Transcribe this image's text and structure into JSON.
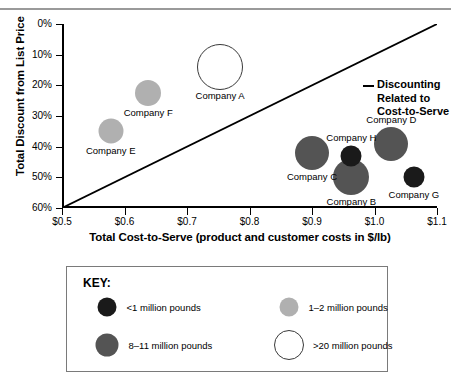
{
  "chart_data": {
    "type": "scatter",
    "title": "",
    "xlabel": "Total Cost-to-Serve (product and customer costs in $/lb)",
    "ylabel": "Total Discount from List Price",
    "xlim": [
      0.5,
      1.1
    ],
    "ylim": [
      0,
      60
    ],
    "y_inverted": true,
    "grid": false,
    "xticks": [
      "$0.5",
      "$0.6",
      "$0.7",
      "$0.8",
      "$0.9",
      "$1.0",
      "$1.1"
    ],
    "xtick_values": [
      0.5,
      0.6,
      0.7,
      0.8,
      0.9,
      1.0,
      1.1
    ],
    "yticks": [
      "0%",
      "10%",
      "20%",
      "30%",
      "40%",
      "50%",
      "60%"
    ],
    "ytick_values": [
      0,
      10,
      20,
      30,
      40,
      50,
      60
    ],
    "annotation": {
      "text_lines": [
        "Discounting",
        "Related to",
        "Cost-to-Serve"
      ],
      "leader": "dash-to-diagonal-line"
    },
    "reference_line": {
      "label": "Discounting Related to Cost-to-Serve",
      "from": [
        0.5,
        60
      ],
      "to": [
        1.1,
        0
      ]
    },
    "points": [
      {
        "name": "Company A",
        "x": 0.753,
        "y": 14.0,
        "size_px": 44,
        "fill": "#ffffff",
        "stroke": "#3a3a3a",
        "category": ">20 million pounds",
        "label_pos": "below"
      },
      {
        "name": "Company B",
        "x": 0.963,
        "y": 50.0,
        "size_px": 36,
        "fill": "#545454",
        "stroke": "none",
        "category": "8-11 million pounds",
        "label_pos": "below"
      },
      {
        "name": "Company C",
        "x": 0.9,
        "y": 42.0,
        "size_px": 34,
        "fill": "#545454",
        "stroke": "none",
        "category": "8-11 million pounds",
        "label_pos": "below"
      },
      {
        "name": "Company D",
        "x": 1.027,
        "y": 39.0,
        "size_px": 34,
        "fill": "#545454",
        "stroke": "none",
        "category": "8-11 million pounds",
        "label_pos": "above"
      },
      {
        "name": "Company E",
        "x": 0.578,
        "y": 35.0,
        "size_px": 25,
        "fill": "#b0b0b0",
        "stroke": "none",
        "category": "1-2 million pounds",
        "label_pos": "below"
      },
      {
        "name": "Company F",
        "x": 0.638,
        "y": 22.5,
        "size_px": 26,
        "fill": "#b0b0b0",
        "stroke": "none",
        "category": "1-2 million pounds",
        "label_pos": "below"
      },
      {
        "name": "Company G",
        "x": 1.063,
        "y": 50.0,
        "size_px": 21,
        "fill": "#1a1a1a",
        "stroke": "none",
        "category": "<1 million pounds",
        "label_pos": "below"
      },
      {
        "name": "Company H",
        "x": 0.963,
        "y": 43.0,
        "size_px": 21,
        "fill": "#1a1a1a",
        "stroke": "none",
        "category": "<1 million pounds",
        "label_pos": "above"
      }
    ],
    "legend": {
      "title": "KEY:",
      "position": "below-chart",
      "entries": [
        {
          "label": "<1 million pounds",
          "fill": "#1a1a1a",
          "stroke": "none",
          "dot_px": 19
        },
        {
          "label": "1–2 million pounds",
          "fill": "#b0b0b0",
          "stroke": "none",
          "dot_px": 19
        },
        {
          "label": "8–11 million pounds",
          "fill": "#545454",
          "stroke": "none",
          "dot_px": 23
        },
        {
          "label": ">20 million pounds",
          "fill": "#ffffff",
          "stroke": "#3a3a3a",
          "dot_px": 28
        }
      ]
    }
  }
}
